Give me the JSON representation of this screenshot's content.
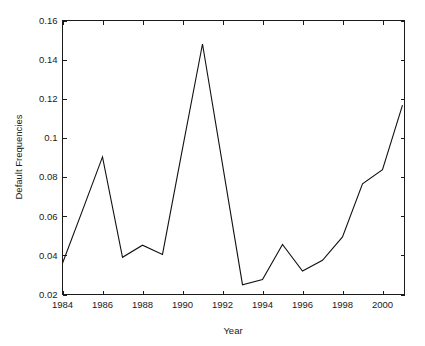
{
  "chart_data": {
    "type": "line",
    "title": "",
    "xlabel": "Year",
    "ylabel": "Default Frequencies",
    "xlim": [
      1984,
      2001.1
    ],
    "ylim": [
      0.02,
      0.16
    ],
    "grid": false,
    "legend": null,
    "xticks": [
      1984,
      1986,
      1988,
      1990,
      1992,
      1994,
      1996,
      1998,
      2000
    ],
    "xticklabels": [
      "1984",
      "1986",
      "1988",
      "1990",
      "1992",
      "1994",
      "1996",
      "1998",
      "2000"
    ],
    "yticks": [
      0.02,
      0.04,
      0.06,
      0.08,
      0.1,
      0.12,
      0.14,
      0.16
    ],
    "yticklabels": [
      "0.02",
      "0.04",
      "0.06",
      "0.08",
      "0.1",
      "0.12",
      "0.14",
      "0.16"
    ],
    "x": [
      1984,
      1985,
      1986,
      1987,
      1988,
      1989,
      1990,
      1991,
      1992,
      1993,
      1994,
      1995,
      1996,
      1997,
      1998,
      1999,
      2000,
      2001
    ],
    "values": [
      0.036,
      0.063,
      0.0903,
      0.039,
      0.0452,
      0.0405,
      0.0945,
      0.148,
      0.0865,
      0.025,
      0.0276,
      0.0456,
      0.032,
      0.0375,
      0.0494,
      0.0765,
      0.0838,
      0.1168
    ],
    "series": [
      {
        "name": "Default Frequencies",
        "color": "#111111",
        "values": [
          0.036,
          0.063,
          0.0903,
          0.039,
          0.0452,
          0.0405,
          0.0945,
          0.148,
          0.0865,
          0.025,
          0.0276,
          0.0456,
          0.032,
          0.0375,
          0.0494,
          0.0765,
          0.0838,
          0.1168
        ]
      }
    ],
    "colors": {
      "line": "#111111",
      "axis": "#1a1a1a",
      "background": "#ffffff"
    }
  },
  "figure": {
    "background": "#ffffff"
  }
}
